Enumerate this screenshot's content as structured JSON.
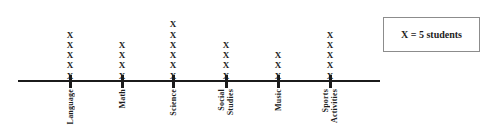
{
  "chart_data": {
    "type": "bar",
    "chart_style": "pictograph",
    "title": "",
    "subtitle": "",
    "xlabel": "",
    "ylabel": "",
    "categories": [
      "Language",
      "Math",
      "Science",
      "Social Studies",
      "Music",
      "Sports Activities"
    ],
    "values": [
      5,
      4,
      6,
      4,
      3,
      5
    ],
    "unit_values": [
      25,
      20,
      30,
      20,
      15,
      25
    ],
    "marker_glyph": "X",
    "marker_unit": 5,
    "legend": "X = 5 students",
    "legend_position": "right",
    "grid": false,
    "axis_orientation": "horizontal",
    "ylim": [
      0,
      6
    ],
    "annotations": []
  },
  "axis": {
    "line_color": "#1b1b1b",
    "tick_color": "#1b1b1b"
  },
  "legend": {
    "label": "X = 5 students",
    "border_color": "#8c8c8c",
    "background": "#ffffff"
  },
  "colors": {
    "ink": "#1d1d1d",
    "axis": "#1b1b1b",
    "legend_border": "#8c8c8c",
    "page_background": "#ffffff"
  },
  "categories": [
    {
      "label_lines": [
        "Language"
      ],
      "count": 5,
      "tick_x": 70
    },
    {
      "label_lines": [
        "Math"
      ],
      "count": 4,
      "tick_x": 122
    },
    {
      "label_lines": [
        "Science"
      ],
      "count": 6,
      "tick_x": 173
    },
    {
      "label_lines": [
        "Social",
        "Studies"
      ],
      "count": 4,
      "tick_x": 226
    },
    {
      "label_lines": [
        "Music"
      ],
      "count": 3,
      "tick_x": 278
    },
    {
      "label_lines": [
        "Sports",
        "Activities"
      ],
      "count": 5,
      "tick_x": 330
    }
  ],
  "marker": {
    "glyph": "X"
  },
  "layout": {
    "axis_y": 80,
    "axis_left": 18,
    "axis_right": 380,
    "axis_thickness": 2,
    "legend_left": 383,
    "legend_top": 17,
    "legend_width": 97,
    "legend_height": 35
  }
}
